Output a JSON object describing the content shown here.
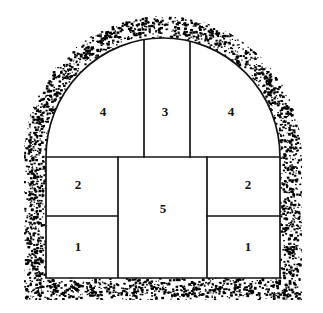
{
  "figure": {
    "name": "tunnel-cross-section-excavation-sequence",
    "background_color": "#ffffff",
    "line_color": "#141414",
    "stipple_color": "#000000",
    "face_color": "#ffffff"
  },
  "geometry": {
    "inner_left": 46,
    "inner_right": 280,
    "inner_bottom": 278,
    "crown_top": 38,
    "springline": 157,
    "mid_divider_left": 118,
    "mid_divider_right": 207,
    "crown_divider_left": 144,
    "crown_divider_right": 190,
    "row_divider": 216,
    "stipple_band_thickness": 22
  },
  "sections": [
    {
      "id": "section-lower-left",
      "label": "1",
      "cx": 78,
      "cy": 248
    },
    {
      "id": "section-lower-right",
      "label": "1",
      "cx": 248,
      "cy": 248
    },
    {
      "id": "section-middle-left",
      "label": "2",
      "cx": 78,
      "cy": 186
    },
    {
      "id": "section-middle-right",
      "label": "2",
      "cx": 248,
      "cy": 186
    },
    {
      "id": "section-crown-center",
      "label": "3",
      "cx": 165,
      "cy": 113
    },
    {
      "id": "section-crown-left",
      "label": "4",
      "cx": 103,
      "cy": 113
    },
    {
      "id": "section-crown-right",
      "label": "4",
      "cx": 231,
      "cy": 113
    },
    {
      "id": "section-core-center",
      "label": "5",
      "cx": 163,
      "cy": 210
    }
  ]
}
